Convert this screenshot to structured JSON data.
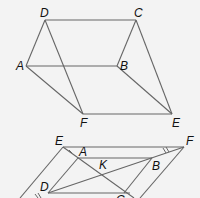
{
  "figure1": {
    "labels": {
      "D": "D",
      "C": "C",
      "A": "A",
      "B": "B",
      "F": "F",
      "E": "E"
    }
  },
  "figure2": {
    "labels": {
      "E": "E",
      "F": "F",
      "A": "A",
      "B": "B",
      "K": "K",
      "D": "D",
      "C": "C"
    }
  },
  "colors": {
    "line": "#666666",
    "label": "#111111",
    "background": "#f3f3f3"
  }
}
